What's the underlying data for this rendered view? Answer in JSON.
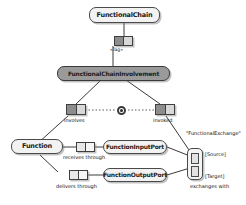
{
  "diagram": {
    "nodes": {
      "functional_chain": "FunctionalChain",
      "functional_chain_involvement": "FunctionalChainInvolvement",
      "function": "Function",
      "function_input_port": "FunctionInputPort",
      "function_output_port": "FunctionOutputPort"
    },
    "edge_labels": {
      "tag": "«Tag»",
      "involves": "involves",
      "invoked": "invoked",
      "receives_through": "receives through",
      "delivers_through": "delivers through",
      "exchanges_with": "exchanges with"
    },
    "exchange": {
      "stereotype": "\"FunctionalExchange\"",
      "source": "[Source]",
      "target": "[Target]"
    },
    "colors": {
      "node_fill": "#f2f2f2",
      "node_shaded_fill": "#9a9a9a",
      "stroke": "#4a4a4a",
      "prop_fill": "#8d8d8d",
      "background": "#ffffff"
    }
  }
}
